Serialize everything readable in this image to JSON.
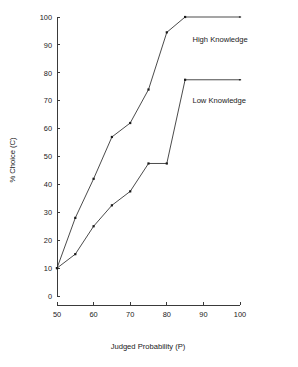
{
  "chart_data": {
    "type": "line",
    "title": "",
    "xlabel": "Judged Probability (P)",
    "ylabel": "% Choice (C)",
    "xlim": [
      50,
      100
    ],
    "ylim": [
      0,
      100
    ],
    "xticks": [
      50,
      60,
      70,
      80,
      90,
      100
    ],
    "yticks": [
      0,
      10,
      20,
      30,
      40,
      50,
      60,
      70,
      80,
      90,
      100
    ],
    "xtick_labels": [
      "50",
      "60",
      "70",
      "80",
      "90",
      "100"
    ],
    "ytick_labels": [
      "0",
      "10",
      "20",
      "30",
      "40",
      "50",
      "60",
      "70",
      "80",
      "90",
      "100"
    ],
    "grid": false,
    "legend_position": "inline-right",
    "line_color": "#2b2b2b",
    "marker_color": "#1a1a1a",
    "axis_color": "#3a3a3a",
    "series": [
      {
        "name": "High Knowledge",
        "label": "High Knowledge",
        "label_x": 87,
        "label_y": 91,
        "x": [
          50,
          55,
          60,
          65,
          70,
          75,
          80,
          85,
          100
        ],
        "values": [
          10,
          28,
          42,
          57,
          62,
          74,
          94.5,
          100,
          100
        ]
      },
      {
        "name": "Low Knowledge",
        "label": "Low Knowledge",
        "label_x": 87,
        "label_y": 69,
        "x": [
          50,
          55,
          60,
          65,
          70,
          75,
          80,
          85,
          100
        ],
        "values": [
          10,
          15,
          25,
          32.5,
          37.5,
          47.5,
          47.5,
          77.5,
          77.5
        ]
      }
    ]
  },
  "figure": {
    "background": "#ffffff",
    "plot_left_px": 57,
    "plot_right_px": 240,
    "plot_top_px": 17,
    "plot_bottom_px": 296,
    "xaxis_line_y_px": 305
  }
}
